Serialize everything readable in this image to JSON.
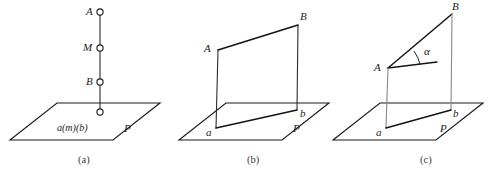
{
  "figure": {
    "background_color": "#ffffff",
    "line_color": "#141414",
    "gray_line_color": "#8d8d8d",
    "label_color": "#1b1b1b"
  },
  "panels": [
    {
      "id": "a",
      "caption": "(a)",
      "caption_pos": {
        "x": 78,
        "y": 163
      },
      "plane": {
        "name": "plane-p",
        "label": "P",
        "label_pos": {
          "x": 124,
          "y": 132
        },
        "points": "10,140 57,103 160,103 113,140"
      },
      "inner_label": {
        "text": "a(m)(b)",
        "pos": {
          "x": 57,
          "y": 131
        }
      },
      "segment": {
        "x": 100,
        "y_top": 12,
        "y_bottom": 112
      },
      "nodes": [
        {
          "name": "point-A",
          "label": "A",
          "cx": 100,
          "cy": 12,
          "r": 3.1,
          "label_pos": {
            "x": 86,
            "y": 15
          }
        },
        {
          "name": "point-M",
          "label": "M",
          "cx": 100,
          "cy": 48,
          "r": 3.1,
          "label_pos": {
            "x": 83,
            "y": 51
          }
        },
        {
          "name": "point-B",
          "label": "B",
          "cx": 100,
          "cy": 82,
          "r": 3.1,
          "label_pos": {
            "x": 86,
            "y": 85
          }
        },
        {
          "name": "point-foot",
          "label": "",
          "cx": 100,
          "cy": 112,
          "r": 3.1,
          "label_pos": {
            "x": 0,
            "y": 0
          }
        }
      ]
    },
    {
      "id": "b",
      "caption": "(b)",
      "caption_pos": {
        "x": 247,
        "y": 163
      },
      "plane": {
        "name": "plane-p",
        "label": "P",
        "label_pos": {
          "x": 293,
          "y": 132
        },
        "points": "179,140 226,103 329,103 282,140"
      },
      "vertices": {
        "A": {
          "x": 218,
          "y": 50,
          "label": "A",
          "label_pos": {
            "x": 204,
            "y": 52
          }
        },
        "B": {
          "x": 298,
          "y": 25,
          "label": "B",
          "label_pos": {
            "x": 300,
            "y": 20
          }
        },
        "a": {
          "x": 216,
          "y": 128,
          "label": "a",
          "label_pos": {
            "x": 206,
            "y": 136
          }
        },
        "b": {
          "x": 297,
          "y": 110,
          "label": "b",
          "label_pos": {
            "x": 300,
            "y": 117
          }
        }
      },
      "edges": [
        {
          "name": "edge-A-B",
          "from": "A",
          "to": "B",
          "style": "solid"
        },
        {
          "name": "edge-A-a",
          "from": "A",
          "to": "a",
          "style": "thin"
        },
        {
          "name": "edge-B-b",
          "from": "B",
          "to": "b",
          "style": "thin"
        },
        {
          "name": "edge-a-b",
          "from": "a",
          "to": "b",
          "style": "solid"
        }
      ]
    },
    {
      "id": "c",
      "caption": "(c)",
      "caption_pos": {
        "x": 420,
        "y": 163
      },
      "plane": {
        "name": "plane-p",
        "label": "P",
        "label_pos": {
          "x": 440,
          "y": 132
        },
        "points": "333,140 380,103 483,103 436,140"
      },
      "vertices": {
        "A": {
          "x": 388,
          "y": 68,
          "label": "A",
          "label_pos": {
            "x": 374,
            "y": 71
          }
        },
        "B": {
          "x": 452,
          "y": 14,
          "label": "B",
          "label_pos": {
            "x": 452,
            "y": 10
          }
        },
        "a": {
          "x": 386,
          "y": 128,
          "label": "a",
          "label_pos": {
            "x": 376,
            "y": 136
          }
        },
        "b": {
          "x": 451,
          "y": 110,
          "label": "b",
          "label_pos": {
            "x": 453,
            "y": 117
          }
        }
      },
      "angle": {
        "name": "angle-alpha",
        "label": "α",
        "label_pos": {
          "x": 424,
          "y": 55
        },
        "vertex": {
          "x": 388,
          "y": 68
        },
        "ray_end": {
          "x": 437,
          "y": 62
        },
        "arc": "M 420,64.4 A 34,34 0 0 0 414,51.2"
      },
      "edges": [
        {
          "name": "edge-A-B",
          "from": "A",
          "to": "B",
          "style": "solid"
        },
        {
          "name": "edge-A-ray",
          "from": "A",
          "to": "ray",
          "style": "solid"
        },
        {
          "name": "edge-A-a",
          "from": "A",
          "to": "a",
          "style": "gray"
        },
        {
          "name": "edge-B-b",
          "from": "B",
          "to": "b",
          "style": "gray"
        },
        {
          "name": "edge-a-b",
          "from": "a",
          "to": "b",
          "style": "solid"
        }
      ]
    }
  ]
}
